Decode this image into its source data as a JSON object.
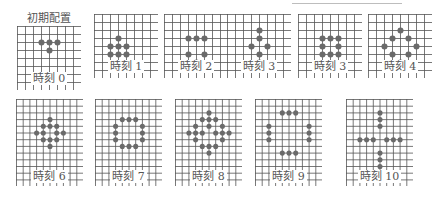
{
  "initial_title": "初期配置",
  "colors": {
    "grid": "#555555",
    "stone": "#6a6a6a",
    "label": "#555555"
  },
  "rows": [
    {
      "grid": {
        "cols": 8,
        "rows": 8,
        "spacing": 8
      },
      "panels": [
        {
          "label": "時刻 0",
          "x": 17,
          "y": 26,
          "cells": [
            [
              3,
              2
            ],
            [
              4,
              2
            ],
            [
              5,
              2
            ],
            [
              4,
              3
            ]
          ]
        },
        {
          "label": "時刻 1",
          "x": 94,
          "y": 14,
          "cells": [
            [
              3,
              3
            ],
            [
              2,
              4
            ],
            [
              3,
              4
            ],
            [
              4,
              4
            ],
            [
              2,
              5
            ],
            [
              3,
              5
            ],
            [
              4,
              5
            ]
          ]
        },
        {
          "label": "時刻 2",
          "x": 164,
          "y": 14,
          "cells": [
            [
              3,
              3
            ],
            [
              4,
              3
            ],
            [
              5,
              3
            ],
            [
              3,
              5
            ],
            [
              5,
              5
            ],
            [
              4,
              6
            ]
          ]
        },
        {
          "label": "時刻 3",
          "x": 227,
          "y": 14,
          "cells": [
            [
              4,
              2
            ],
            [
              4,
              3
            ],
            [
              3,
              4
            ],
            [
              5,
              4
            ],
            [
              4,
              5
            ],
            [
              4,
              6
            ]
          ]
        },
        {
          "label": "時刻 3",
          "x": 298,
          "y": 14,
          "cells": [
            [
              3,
              3
            ],
            [
              4,
              3
            ],
            [
              5,
              3
            ],
            [
              3,
              4
            ],
            [
              5,
              4
            ],
            [
              3,
              5
            ],
            [
              4,
              5
            ],
            [
              5,
              5
            ]
          ]
        },
        {
          "label": "時刻 4",
          "x": 368,
          "y": 14,
          "cells": [
            [
              4,
              2
            ],
            [
              3,
              3
            ],
            [
              5,
              3
            ],
            [
              2,
              4
            ],
            [
              6,
              4
            ],
            [
              3,
              5
            ],
            [
              5,
              5
            ],
            [
              4,
              6
            ]
          ]
        }
      ]
    },
    {
      "grid": {
        "cols": 10,
        "rows": 13,
        "spacing": 6.7
      },
      "panels": [
        {
          "label": "時刻 6",
          "x": 16,
          "y": 99,
          "cells": [
            [
              5,
              3
            ],
            [
              4,
              4
            ],
            [
              5,
              4
            ],
            [
              6,
              4
            ],
            [
              3,
              5
            ],
            [
              4,
              5
            ],
            [
              6,
              5
            ],
            [
              7,
              5
            ],
            [
              4,
              6
            ],
            [
              5,
              6
            ],
            [
              6,
              6
            ],
            [
              5,
              7
            ]
          ]
        },
        {
          "label": "時刻 7",
          "x": 95,
          "y": 99,
          "cells": [
            [
              4,
              3
            ],
            [
              5,
              3
            ],
            [
              6,
              3
            ],
            [
              3,
              4
            ],
            [
              7,
              4
            ],
            [
              3,
              5
            ],
            [
              7,
              5
            ],
            [
              3,
              6
            ],
            [
              7,
              6
            ],
            [
              4,
              7
            ],
            [
              5,
              7
            ],
            [
              6,
              7
            ]
          ]
        },
        {
          "label": "時刻 8",
          "x": 175,
          "y": 99,
          "cells": [
            [
              5,
              2
            ],
            [
              4,
              3
            ],
            [
              5,
              3
            ],
            [
              6,
              3
            ],
            [
              3,
              4
            ],
            [
              5,
              4
            ],
            [
              7,
              4
            ],
            [
              2,
              5
            ],
            [
              3,
              5
            ],
            [
              4,
              5
            ],
            [
              6,
              5
            ],
            [
              7,
              5
            ],
            [
              8,
              5
            ],
            [
              3,
              6
            ],
            [
              7,
              6
            ],
            [
              4,
              7
            ],
            [
              5,
              7
            ],
            [
              6,
              7
            ],
            [
              5,
              8
            ]
          ]
        },
        {
          "label": "時刻 9",
          "x": 255,
          "y": 99,
          "cells": [
            [
              4,
              2
            ],
            [
              5,
              2
            ],
            [
              6,
              2
            ],
            [
              2,
              4
            ],
            [
              2,
              5
            ],
            [
              2,
              6
            ],
            [
              8,
              4
            ],
            [
              8,
              5
            ],
            [
              8,
              6
            ],
            [
              4,
              8
            ],
            [
              5,
              8
            ],
            [
              6,
              8
            ]
          ]
        },
        {
          "label": "時刻 10",
          "x": 346,
          "y": 99,
          "cells": [
            [
              5,
              2
            ],
            [
              5,
              3
            ],
            [
              5,
              4
            ],
            [
              2,
              6
            ],
            [
              3,
              6
            ],
            [
              4,
              6
            ],
            [
              6,
              6
            ],
            [
              7,
              6
            ],
            [
              8,
              6
            ],
            [
              5,
              8
            ],
            [
              5,
              9
            ],
            [
              5,
              10
            ]
          ]
        }
      ]
    }
  ]
}
